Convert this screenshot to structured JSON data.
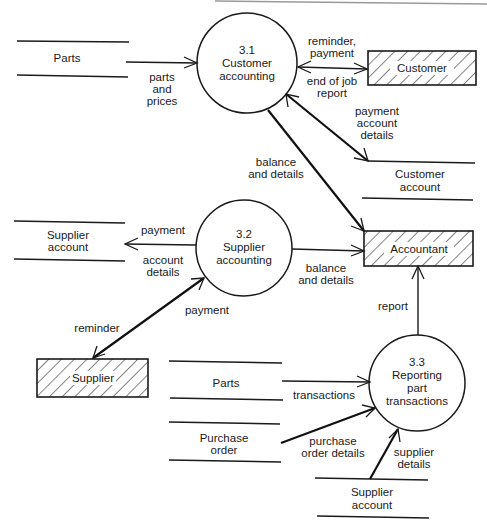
{
  "diagram": {
    "type": "data-flow-diagram",
    "processes": [
      {
        "id": "3.1",
        "number": "3.1",
        "line1": "Customer",
        "line2": "accounting",
        "line3": ""
      },
      {
        "id": "3.2",
        "number": "3.2",
        "line1": "Supplier",
        "line2": "accounting",
        "line3": ""
      },
      {
        "id": "3.3",
        "number": "3.3",
        "line1": "Reporting",
        "line2": "part",
        "line3": "transactions"
      }
    ],
    "entities": [
      {
        "id": "customer",
        "label": "Customer"
      },
      {
        "id": "accountant",
        "label": "Accountant"
      },
      {
        "id": "supplier",
        "label": "Supplier"
      }
    ],
    "stores": [
      {
        "id": "parts_top",
        "line1": "Parts",
        "line2": ""
      },
      {
        "id": "customer_account",
        "line1": "Customer",
        "line2": "account"
      },
      {
        "id": "supplier_account_left",
        "line1": "Supplier",
        "line2": "account"
      },
      {
        "id": "parts_bottom",
        "line1": "Parts",
        "line2": ""
      },
      {
        "id": "purchase_order",
        "line1": "Purchase",
        "line2": "order"
      },
      {
        "id": "supplier_account_bottom",
        "line1": "Supplier",
        "line2": "account"
      }
    ],
    "flows": [
      {
        "from": "parts_top",
        "to": "3.1",
        "label_lines": [
          "parts",
          "and",
          "prices"
        ]
      },
      {
        "from": "3.1",
        "to": "customer",
        "label_lines": [
          "reminder,",
          "payment"
        ]
      },
      {
        "from": "customer",
        "to": "3.1",
        "label_lines": [
          "end of job",
          "report"
        ]
      },
      {
        "from": "3.1",
        "to": "customer_account",
        "bidirectional": true,
        "label_lines": [
          "payment",
          "account",
          "details"
        ]
      },
      {
        "from": "3.1",
        "to": "accountant",
        "label_lines": [
          "balance",
          "and details"
        ]
      },
      {
        "from": "3.2",
        "to": "supplier_account_left",
        "label_lines": [
          "payment"
        ]
      },
      {
        "from": "supplier_account_left",
        "to": "3.2",
        "label_lines": [
          "account",
          "details"
        ]
      },
      {
        "from": "3.2",
        "to": "accountant",
        "label_lines": [
          "balance",
          "and details"
        ]
      },
      {
        "from": "supplier",
        "to": "3.2",
        "bidirectional": true,
        "label_lines": [
          "payment"
        ],
        "reverse_label_lines": [
          "reminder"
        ]
      },
      {
        "from": "3.3",
        "to": "accountant",
        "label_lines": [
          "report"
        ]
      },
      {
        "from": "parts_bottom",
        "to": "3.3",
        "label_lines": [
          "transactions"
        ]
      },
      {
        "from": "purchase_order",
        "to": "3.3",
        "label_lines": [
          "purchase",
          "order details"
        ]
      },
      {
        "from": "supplier_account_bottom",
        "to": "3.3",
        "label_lines": [
          "supplier",
          "details"
        ]
      }
    ]
  },
  "labels": {
    "parts_and_prices": [
      "parts",
      "and",
      "prices"
    ],
    "reminder_payment": [
      "reminder,",
      "payment"
    ],
    "end_of_job_report": [
      "end of job",
      "report"
    ],
    "payment_account_details": [
      "payment",
      "account",
      "details"
    ],
    "balance_details_1": [
      "balance",
      "and details"
    ],
    "payment_left": "payment",
    "account_details": [
      "account",
      "details"
    ],
    "balance_details_2": [
      "balance",
      "and details"
    ],
    "payment_supplier": "payment",
    "reminder": "reminder",
    "report": "report",
    "transactions": "transactions",
    "purchase_order_details": [
      "purchase",
      "order details"
    ],
    "supplier_details": [
      "supplier",
      "details"
    ]
  },
  "colors": {
    "ink": "#1a1a1a",
    "background": "#ffffff",
    "page_edge": "#9a9a9a"
  }
}
